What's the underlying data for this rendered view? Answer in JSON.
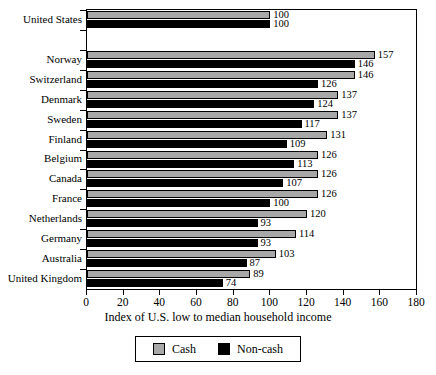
{
  "chart_data": {
    "type": "bar",
    "orientation": "horizontal",
    "title": "",
    "xlabel": "Index of U.S. low to median household income",
    "ylabel": "",
    "xlim": [
      0,
      180
    ],
    "xticks": [
      0,
      20,
      40,
      60,
      80,
      100,
      120,
      140,
      160,
      180
    ],
    "grid": false,
    "legend_position": "bottom",
    "colors": {
      "cash": "#a8a8a8",
      "noncash": "#000000",
      "axis": "#000000",
      "background": "#ffffff"
    },
    "categories": [
      "United States",
      "",
      "Norway",
      "Switzerland",
      "Denmark",
      "Sweden",
      "Finland",
      "Belgium",
      "Canada",
      "France",
      "Netherlands",
      "Germany",
      "Australia",
      "United Kingdom"
    ],
    "series": [
      {
        "name": "Cash",
        "color": "#a8a8a8",
        "values": [
          100,
          null,
          157,
          146,
          137,
          137,
          131,
          126,
          126,
          126,
          120,
          114,
          103,
          89
        ]
      },
      {
        "name": "Non-cash",
        "color": "#000000",
        "values": [
          100,
          null,
          146,
          126,
          124,
          117,
          109,
          113,
          107,
          100,
          93,
          93,
          87,
          74
        ]
      }
    ],
    "legend": [
      {
        "label": "Cash",
        "color": "#a8a8a8"
      },
      {
        "label": "Non-cash",
        "color": "#000000"
      }
    ]
  }
}
